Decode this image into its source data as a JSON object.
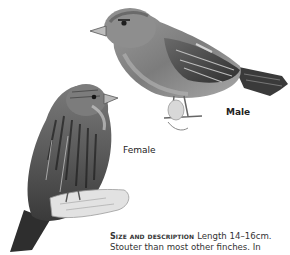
{
  "illustrations": [
    {
      "id": "male",
      "subject": "male finch, perched, facing left",
      "style": "grayscale pencil drawing"
    },
    {
      "id": "female",
      "subject": "female finch, streaked, perched on branch, facing right",
      "style": "grayscale pencil drawing"
    }
  ],
  "labels": {
    "male": "Male",
    "female": "Female"
  },
  "description": {
    "heading": "Size and description",
    "line1_text": "Length 14–16cm.",
    "line2_text": "Stouter than most other finches. In"
  },
  "colors": {
    "background": "#ffffff",
    "text": "#2a2a2a",
    "illustration_dark": "#2b2b2b",
    "illustration_mid": "#8a8a8a",
    "illustration_light": "#c9c9c9"
  }
}
